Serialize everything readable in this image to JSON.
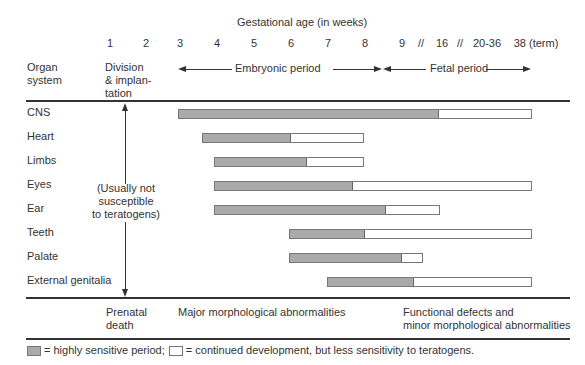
{
  "title": "Gestational age (in weeks)",
  "ticks": [
    {
      "label": "1",
      "x": 110
    },
    {
      "label": "2",
      "x": 146
    },
    {
      "label": "3",
      "x": 180
    },
    {
      "label": "4",
      "x": 217
    },
    {
      "label": "5",
      "x": 254
    },
    {
      "label": "6",
      "x": 291
    },
    {
      "label": "7",
      "x": 328
    },
    {
      "label": "8",
      "x": 365
    },
    {
      "label": "9",
      "x": 402
    },
    {
      "label": "//",
      "x": 421
    },
    {
      "label": "16",
      "x": 442
    },
    {
      "label": "//",
      "x": 460
    },
    {
      "label": "20-36",
      "x": 487
    },
    {
      "label": "38 (term)",
      "x": 536
    }
  ],
  "headers": {
    "organ_system_line1": "Organ",
    "organ_system_line2": "system",
    "division_line1": "Division",
    "division_line2": "& implan-",
    "division_line3": "tation",
    "embryonic_period": "Embryonic period",
    "fetal_period": "Fetal period"
  },
  "susceptibility_note": {
    "line1": "(Usually not",
    "line2": "susceptible",
    "line3": "to teratogens)"
  },
  "outcomes": {
    "prenatal_death_line1": "Prenatal",
    "prenatal_death_line2": "death",
    "major": "Major morphological abnormalities",
    "functional_line1": "Functional defects and",
    "functional_line2": "minor morphological abnormalities"
  },
  "legend": {
    "gray_label": "= highly sensitive period;",
    "white_label": "= continued development, but less sensitivity to teratogens."
  },
  "colors": {
    "sensitive": "#aaaaaa",
    "continued": "#ffffff",
    "ink": "#333333"
  },
  "chart_data": {
    "type": "gantt",
    "title": "Gestational age (in weeks)",
    "xlabel": "Gestational age (in weeks)",
    "x_ticks": [
      "1",
      "2",
      "3",
      "4",
      "5",
      "6",
      "7",
      "8",
      "9",
      "16",
      "20-36",
      "38 (term)"
    ],
    "periods": [
      {
        "name": "Division & implantation",
        "weeks": "1-2"
      },
      {
        "name": "Embryonic period",
        "weeks": "3-8"
      },
      {
        "name": "Fetal period",
        "weeks": "9-38"
      }
    ],
    "series": [
      {
        "organ": "CNS",
        "sensitive_start": "3",
        "sensitive_end": "16",
        "continued_end": "38 (term)"
      },
      {
        "organ": "Heart",
        "sensitive_start": "3.5",
        "sensitive_end": "6",
        "continued_end": "8"
      },
      {
        "organ": "Limbs",
        "sensitive_start": "4",
        "sensitive_end": "6.5",
        "continued_end": "8"
      },
      {
        "organ": "Eyes",
        "sensitive_start": "4",
        "sensitive_end": "7.8",
        "continued_end": "38 (term)"
      },
      {
        "organ": "Ear",
        "sensitive_start": "4",
        "sensitive_end": "8.6",
        "continued_end": "16"
      },
      {
        "organ": "Teeth",
        "sensitive_start": "6",
        "sensitive_end": "8",
        "continued_end": "38 (term)"
      },
      {
        "organ": "Palate",
        "sensitive_start": "6",
        "sensitive_end": "9",
        "continued_end": "9.5"
      },
      {
        "organ": "External genitalia",
        "sensitive_start": "7",
        "sensitive_end": "9.3",
        "continued_end": "38 (term)"
      }
    ],
    "legend": [
      "highly sensitive period",
      "continued development, but less sensitivity to teratogens"
    ]
  },
  "rows": [
    {
      "organ": "CNS",
      "y": 114,
      "start": 178,
      "gray_end": 437,
      "end": 530
    },
    {
      "organ": "Heart",
      "y": 138,
      "start": 202,
      "gray_end": 289,
      "end": 362
    },
    {
      "organ": "Limbs",
      "y": 162,
      "start": 214,
      "gray_end": 305,
      "end": 362
    },
    {
      "organ": "Eyes",
      "y": 186,
      "start": 214,
      "gray_end": 351,
      "end": 530
    },
    {
      "organ": "Ear",
      "y": 210,
      "start": 214,
      "gray_end": 384,
      "end": 438
    },
    {
      "organ": "Teeth",
      "y": 234,
      "start": 289,
      "gray_end": 363,
      "end": 530
    },
    {
      "organ": "Palate",
      "y": 258,
      "start": 289,
      "gray_end": 400,
      "end": 421
    },
    {
      "organ": "External genitalia",
      "y": 282,
      "start": 327,
      "gray_end": 412,
      "end": 530
    }
  ]
}
